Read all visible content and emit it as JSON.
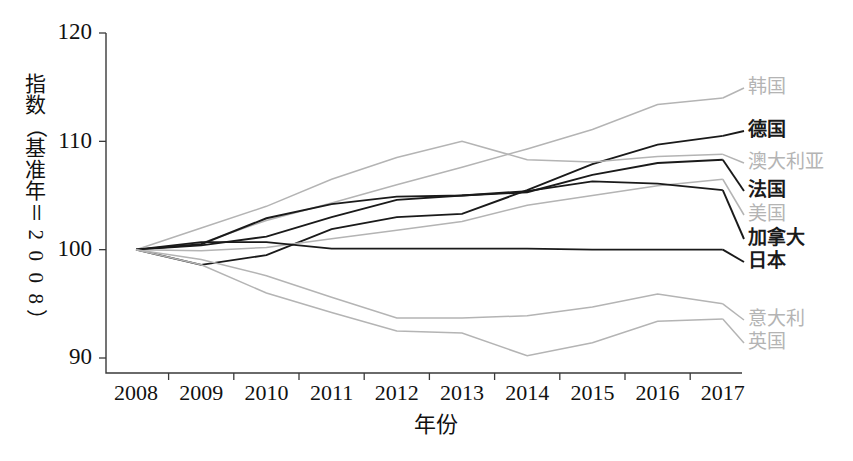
{
  "figure": {
    "background_color": "#ffffff",
    "y_axis_title": "指数（基准年＝2008）",
    "y_axis_title_glyphs": [
      "指",
      "数",
      "（",
      "基",
      "准",
      "年",
      "＝",
      "2",
      "0",
      "0",
      "8",
      "）"
    ],
    "x_axis_title": "年份"
  },
  "chart_data": {
    "type": "line",
    "title": "",
    "subtitle": "",
    "xlabel": "年份",
    "ylabel": "指数（基准年＝2008）",
    "x": [
      2008,
      2009,
      2010,
      2011,
      2012,
      2013,
      2014,
      2015,
      2016,
      2017
    ],
    "xtick_labels": [
      "2008",
      "2009",
      "2010",
      "2011",
      "2012",
      "2013",
      "2014",
      "2015",
      "2016",
      "2017"
    ],
    "ytick_labels": [
      "90",
      "100",
      "110",
      "120"
    ],
    "yticks": [
      90,
      100,
      110,
      120
    ],
    "ylim": [
      88.5,
      120
    ],
    "xlim": [
      2007.6,
      2017.4
    ],
    "grid": false,
    "legend_position": "right-of-plot-line-ends",
    "series": [
      {
        "name": "韩国",
        "color": "#b4b4b4",
        "emphasis": "grey",
        "stroke_width": 1.5,
        "values": [
          100.0,
          100.6,
          102.7,
          104.3,
          106.0,
          107.6,
          109.3,
          111.1,
          113.4,
          114.0
        ],
        "label_value": 114.0
      },
      {
        "name": "德国",
        "color": "#1a1a1a",
        "emphasis": "dark",
        "stroke_width": 1.9,
        "values": [
          100.0,
          98.6,
          99.5,
          101.9,
          103.0,
          103.3,
          105.5,
          107.9,
          109.7,
          110.5
        ],
        "label_value": 110.5
      },
      {
        "name": "澳大利亚",
        "color": "#b4b4b4",
        "emphasis": "grey",
        "stroke_width": 1.5,
        "values": [
          100.0,
          102.0,
          104.0,
          106.5,
          108.5,
          110.0,
          108.3,
          108.1,
          108.6,
          108.8
        ],
        "label_value": 108.8
      },
      {
        "name": "法国",
        "color": "#1a1a1a",
        "emphasis": "dark",
        "stroke_width": 1.9,
        "values": [
          100.0,
          100.4,
          101.2,
          103.0,
          104.6,
          105.0,
          105.3,
          106.9,
          108.0,
          108.3
        ],
        "label_value": 108.3
      },
      {
        "name": "美国",
        "color": "#b4b4b4",
        "emphasis": "grey",
        "stroke_width": 1.5,
        "values": [
          100.0,
          99.9,
          100.2,
          101.0,
          101.8,
          102.6,
          104.1,
          105.0,
          105.9,
          106.5
        ],
        "label_value": 106.5
      },
      {
        "name": "加拿大",
        "color": "#1a1a1a",
        "emphasis": "dark",
        "stroke_width": 1.9,
        "values": [
          100.0,
          100.5,
          102.9,
          104.2,
          104.9,
          105.0,
          105.4,
          106.3,
          106.1,
          105.5
        ],
        "label_value": 105.5
      },
      {
        "name": "日本",
        "color": "#1a1a1a",
        "emphasis": "dark",
        "stroke_width": 1.9,
        "values": [
          100.0,
          100.7,
          100.7,
          100.1,
          100.1,
          100.1,
          100.1,
          100.0,
          100.0,
          100.0
        ],
        "label_value": 100.0
      },
      {
        "name": "意大利",
        "color": "#b4b4b4",
        "emphasis": "grey",
        "stroke_width": 1.5,
        "values": [
          100.0,
          99.1,
          97.6,
          95.6,
          93.7,
          93.7,
          93.9,
          94.7,
          95.9,
          95.0
        ],
        "label_value": 95.0
      },
      {
        "name": "英国",
        "color": "#b4b4b4",
        "emphasis": "grey",
        "stroke_width": 1.5,
        "values": [
          100.0,
          98.6,
          96.0,
          94.2,
          92.5,
          92.3,
          90.2,
          91.4,
          93.4,
          93.6
        ],
        "label_value": 93.6
      }
    ],
    "legend_entries": [
      {
        "label": "韩国",
        "color": "#b4b4b4",
        "emphasis": "grey"
      },
      {
        "label": "德国",
        "color": "#1a1a1a",
        "emphasis": "dark"
      },
      {
        "label": "澳大利亚",
        "color": "#b4b4b4",
        "emphasis": "grey"
      },
      {
        "label": "法国",
        "color": "#1a1a1a",
        "emphasis": "dark"
      },
      {
        "label": "美国",
        "color": "#b4b4b4",
        "emphasis": "grey"
      },
      {
        "label": "加拿大",
        "color": "#1a1a1a",
        "emphasis": "dark"
      },
      {
        "label": "日本",
        "color": "#1a1a1a",
        "emphasis": "dark"
      },
      {
        "label": "意大利",
        "color": "#b4b4b4",
        "emphasis": "grey"
      },
      {
        "label": "英国",
        "color": "#b4b4b4",
        "emphasis": "grey"
      }
    ]
  }
}
